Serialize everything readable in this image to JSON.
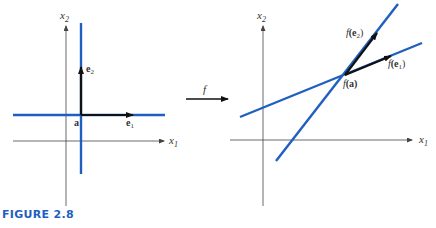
{
  "figure": {
    "caption": "FIGURE 2.8",
    "colors": {
      "line": "#1f5fbf",
      "axis": "#444444",
      "vector": "#111111",
      "caption": "#1f5fbf"
    },
    "map_label": "f",
    "left_panel": {
      "x_axis_label": "x",
      "x_axis_sub": "1",
      "y_axis_label": "x",
      "y_axis_sub": "2",
      "point_label": "a",
      "vector1_label": "e",
      "vector1_sub": "1",
      "vector2_label": "e",
      "vector2_sub": "2"
    },
    "right_panel": {
      "x_axis_label": "x",
      "x_axis_sub": "1",
      "y_axis_label": "x",
      "y_axis_sub": "2",
      "point_label_f": "f",
      "point_label": "(a)",
      "vector1_f": "f",
      "vector1_label": "(e",
      "vector1_sub": "1",
      "vector1_close": ")",
      "vector2_f": "f",
      "vector2_label": "(e",
      "vector2_sub": "2",
      "vector2_close": ")"
    }
  }
}
